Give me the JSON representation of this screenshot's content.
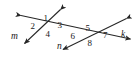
{
  "figure": {
    "stroke_color": "#262626",
    "text_color": "#1a1a1a",
    "background": "#ffffff",
    "width": 136,
    "height": 57
  },
  "lines": [
    {
      "id": "line-m",
      "label": "m",
      "label_x": 11,
      "label_y": 32,
      "x1": 60.5,
      "y1": 9.5,
      "x2": 24.5,
      "y2": 43.5,
      "arrow_start": true,
      "arrow_end": true
    },
    {
      "id": "line-n",
      "label": "n",
      "label_x": 57,
      "label_y": 41.5,
      "x1": 126.5,
      "y1": 18.5,
      "x2": 63.0,
      "y2": 49.5,
      "arrow_start": true,
      "arrow_end": true
    },
    {
      "id": "line-k",
      "label": "k",
      "label_x": 121,
      "label_y": 29.5,
      "x1": 21.0,
      "y1": 15.5,
      "x2": 130.5,
      "y2": 39.0,
      "arrow_start": true,
      "arrow_end": true
    }
  ],
  "intersections": [
    {
      "id": "left-intersection",
      "x": 48,
      "y": 25
    },
    {
      "id": "right-intersection",
      "x": 90,
      "y": 35
    }
  ],
  "angle_labels": [
    {
      "id": "angle-1",
      "text": "1",
      "x": 43.5,
      "y": 13.5
    },
    {
      "id": "angle-2",
      "text": "2",
      "x": 30.5,
      "y": 22.0
    },
    {
      "id": "angle-3",
      "text": "3",
      "x": 57.5,
      "y": 21.0
    },
    {
      "id": "angle-4",
      "text": "4",
      "x": 45.5,
      "y": 29.5
    },
    {
      "id": "angle-5",
      "text": "5",
      "x": 85.5,
      "y": 24.0
    },
    {
      "id": "angle-6",
      "text": "6",
      "x": 70.5,
      "y": 31.5
    },
    {
      "id": "angle-7",
      "text": "7",
      "x": 103.0,
      "y": 31.0
    },
    {
      "id": "angle-8",
      "text": "8",
      "x": 87.5,
      "y": 38.5
    }
  ]
}
